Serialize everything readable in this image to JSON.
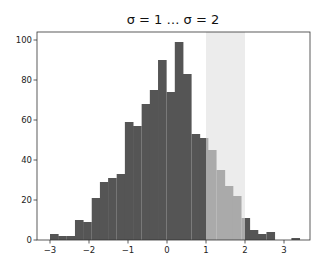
{
  "chart_data": {
    "type": "bar",
    "title": "σ = 1 … σ = 2",
    "xlabel": "",
    "ylabel": "",
    "xlim": [
      -3.4,
      3.7
    ],
    "ylim": [
      0,
      104
    ],
    "grid": false,
    "legend": null,
    "x_ticks": [
      "−3",
      "−2",
      "−1",
      "0",
      "1",
      "2",
      "3"
    ],
    "x_tick_values": [
      -3,
      -2,
      -1,
      0,
      1,
      2,
      3
    ],
    "y_ticks": [
      "0",
      "20",
      "40",
      "60",
      "80",
      "100"
    ],
    "y_tick_values": [
      0,
      20,
      40,
      60,
      80,
      100
    ],
    "bin_width": 0.213,
    "bin_starts": [
      -3.0,
      -2.79,
      -2.57,
      -2.36,
      -2.15,
      -1.93,
      -1.72,
      -1.51,
      -1.29,
      -1.08,
      -0.87,
      -0.65,
      -0.44,
      -0.23,
      -0.01,
      0.2,
      0.41,
      0.63,
      0.84,
      1.05,
      1.27,
      1.48,
      1.69,
      1.91,
      2.12,
      2.33,
      2.55,
      2.76,
      2.97,
      3.19
    ],
    "values": [
      3,
      2,
      2,
      10,
      9,
      21,
      29,
      31,
      33,
      59,
      57,
      68,
      75,
      90,
      74,
      99,
      83,
      53,
      51,
      45,
      35,
      27,
      22,
      11,
      5,
      3,
      4,
      0,
      0,
      1
    ],
    "highlight_span": {
      "from": 1,
      "to": 2
    },
    "annotations": [
      "shaded vertical span from σ=1 to σ=2; bars within span drawn in lighter gray"
    ],
    "colors": {
      "bar": "#555555",
      "bar_highlight": "#aaaaaa",
      "span": "#ececec",
      "axis": "#333333"
    }
  }
}
